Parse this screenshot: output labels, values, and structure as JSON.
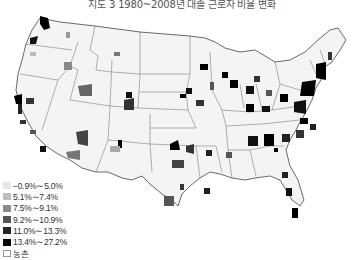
{
  "title": "지도 3 1980~2008년 대졸 근로자 비율 변화",
  "legend": {
    "items": [
      {
        "label": "−0.9%∼5.0%",
        "color": "#e6e6e6"
      },
      {
        "label": "5.1%∼7.4%",
        "color": "#bdbdbd"
      },
      {
        "label": "7.5%∼9.1%",
        "color": "#8c8c8c"
      },
      {
        "label": "9.2%∼10.9%",
        "color": "#555555"
      },
      {
        "label": "11.0%∼13.3%",
        "color": "#262626"
      },
      {
        "label": "13.4%∼27.2%",
        "color": "#000000"
      },
      {
        "label": "농촌",
        "color": "#ffffff"
      }
    ]
  },
  "map": {
    "region": "United States (contiguous)",
    "colors": {
      "land": "#f7f7f7",
      "border": "#555555",
      "light": "#e6e6e6",
      "c1": "#bdbdbd",
      "c2": "#8c8c8c",
      "c3": "#555555",
      "c4": "#262626",
      "c5": "#000000"
    }
  }
}
